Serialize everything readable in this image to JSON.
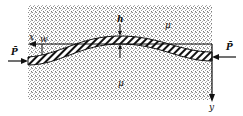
{
  "diagram": {
    "labels": {
      "x_axis": "x",
      "y_axis": "y",
      "deflection": "w",
      "thickness": "h",
      "medium_top": "μ",
      "medium_bottom": "μ",
      "force_left": "P̄",
      "force_right": "P̄"
    },
    "colors": {
      "ink": "#111111",
      "stipple": "#9a9a9a",
      "background": "#ffffff"
    }
  }
}
